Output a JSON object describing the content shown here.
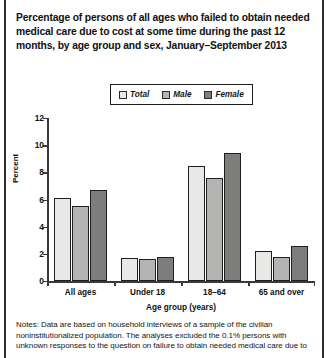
{
  "title": "Percentage of persons of all ages who failed to obtain needed medical care due to cost at some time during the past 12 months, by age group and sex, January–September 2013",
  "legend": {
    "items": [
      {
        "label": "Total",
        "color": "#e8e8e6"
      },
      {
        "label": "Male",
        "color": "#b4b4b2"
      },
      {
        "label": "Female",
        "color": "#7d7d7b"
      }
    ]
  },
  "axes": {
    "ylabel": "Percent",
    "xlabel": "Age group (years)",
    "yticks": [
      "0",
      "2",
      "4",
      "6",
      "8",
      "10",
      "12"
    ]
  },
  "notes": {
    "text": "Notes: Data are based on household interviews of a sample of the civilian noninstitutionalized population. The analyses excluded the 0.1% persons with unknown responses to the question on failure to obtain needed medical care due to"
  },
  "chart_data": {
    "type": "bar",
    "title": "Percentage of persons of all ages who failed to obtain needed medical care due to cost at some time during the past 12 months, by age group and sex, January–September 2013",
    "xlabel": "Age group (years)",
    "ylabel": "Percent",
    "ylim": [
      0,
      12
    ],
    "ytick_step": 2,
    "grid": false,
    "legend_position": "top-center",
    "categories": [
      "All ages",
      "Under 18",
      "18–64",
      "65 and over"
    ],
    "series": [
      {
        "name": "Total",
        "color": "#e8e8e6",
        "values": [
          6.1,
          1.7,
          8.5,
          2.2
        ]
      },
      {
        "name": "Male",
        "color": "#b4b4b2",
        "values": [
          5.5,
          1.6,
          7.6,
          1.8
        ]
      },
      {
        "name": "Female",
        "color": "#7d7d7b",
        "values": [
          6.7,
          1.8,
          9.4,
          2.6
        ]
      }
    ]
  }
}
